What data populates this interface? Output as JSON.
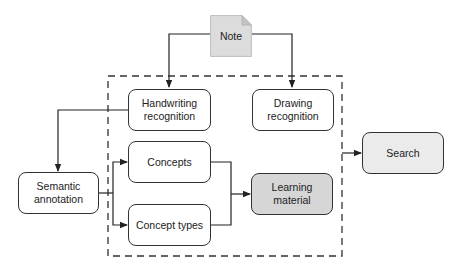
{
  "diagram": {
    "note": {
      "label": "Note"
    },
    "nodes": {
      "handwriting": {
        "line1": "Handwriting",
        "line2": "recognition"
      },
      "drawing": {
        "line1": "Drawing",
        "line2": "recognition"
      },
      "concepts": {
        "label": "Concepts"
      },
      "concept_types": {
        "label": "Concept types"
      },
      "semantic": {
        "line1": "Semantic",
        "line2": "annotation"
      },
      "learning": {
        "label": "Learning material"
      },
      "search": {
        "label": "Search"
      }
    },
    "edges": [
      {
        "from": "Note",
        "to": "Handwriting recognition"
      },
      {
        "from": "Note",
        "to": "Drawing recognition"
      },
      {
        "from": "Handwriting recognition",
        "to": "Semantic annotation"
      },
      {
        "from": "Semantic annotation",
        "to": "Concepts"
      },
      {
        "from": "Semantic annotation",
        "to": "Concept types"
      },
      {
        "from": "Concepts",
        "to": "Learning material"
      },
      {
        "from": "Concept types",
        "to": "Learning material"
      },
      {
        "from": "Dashed group",
        "to": "Search"
      }
    ],
    "colors": {
      "stroke": "#333333",
      "learning_fill": "#d6d6d6",
      "search_fill": "#ebebeb",
      "note_fill": "#dcdcdc"
    }
  }
}
